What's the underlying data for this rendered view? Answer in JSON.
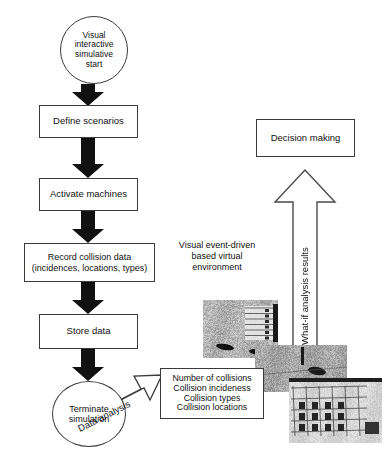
{
  "diagram": {
    "colors": {
      "stroke": "#3a3a3a",
      "arrow_fill": "#111111",
      "hollow_arrow_stroke": "#4a4a4a",
      "text": "#111111",
      "background": "#ffffff"
    },
    "nodes": {
      "start": {
        "label": "Visual\ninteractive\nsimulative\nstart",
        "shape": "ellipse"
      },
      "define_scenarios": {
        "label": "Define scenarios",
        "shape": "rectangle"
      },
      "activate_machines": {
        "label": "Activate machines",
        "shape": "rectangle"
      },
      "record_collision_data": {
        "label": "Record collision data\n(incidences, locations, types)",
        "shape": "rectangle"
      },
      "store_data": {
        "label": "Store data",
        "shape": "rectangle"
      },
      "terminate_simulation": {
        "label": "Terminate\nsimulation",
        "shape": "ellipse"
      },
      "results": {
        "label": "Number of collisions\nCollision incideness\nCollision types\nCollision locations",
        "shape": "rectangle"
      },
      "decision_making": {
        "label": "Decision making",
        "shape": "rectangle"
      }
    },
    "labels": {
      "virtual_environment": "Visual event-driven\nbased virtual\nenvironment",
      "data_analysis": "Data analysis",
      "what_if": "What-if analysis results"
    },
    "photos": {
      "top_left": "site-aerial-view-with-building",
      "middle": "site-ground-collision-view",
      "bottom_right": "building-facade-grid-view"
    }
  }
}
